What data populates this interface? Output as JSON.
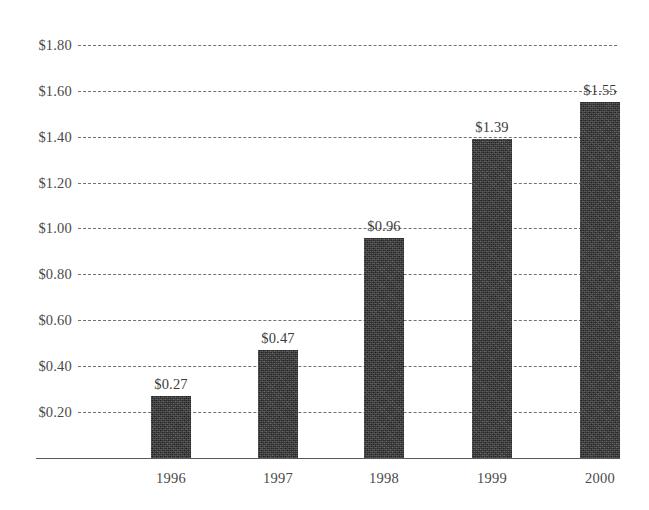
{
  "chart_data": {
    "type": "bar",
    "title": "",
    "subtitle": "",
    "xlabel": "",
    "ylabel": "",
    "categories": [
      "1996",
      "1997",
      "1998",
      "1999",
      "2000"
    ],
    "values": [
      0.27,
      0.47,
      0.96,
      1.39,
      1.55
    ],
    "value_labels": [
      "$0.27",
      "$0.47",
      "$0.96",
      "$1.39",
      "$1.55"
    ],
    "ylim": [
      0,
      1.8
    ],
    "ytick_values": [
      0.2,
      0.4,
      0.6,
      0.8,
      1.0,
      1.2,
      1.4,
      1.6,
      1.8
    ],
    "ytick_labels": [
      "$0.20",
      "$0.40",
      "$0.60",
      "$0.80",
      "$1.00",
      "$1.20",
      "$1.40",
      "$1.60",
      "$1.80"
    ],
    "grid": true,
    "grid_style": "dashed",
    "legend": false,
    "legend_position": "none",
    "bar_color": "#3a3a3a",
    "grid_color": "#5a5a5a",
    "axis_color": "#59595b",
    "text_color": "#4a4a4a"
  }
}
